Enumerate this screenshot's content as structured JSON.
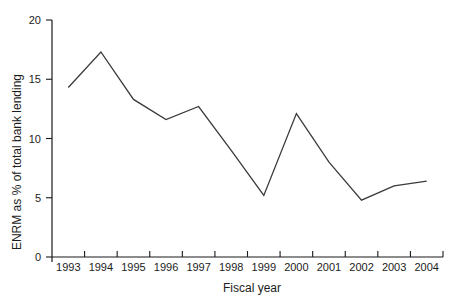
{
  "chart_data": {
    "type": "line",
    "title": "",
    "xlabel": "Fiscal year",
    "ylabel": "ENRM as % of total bank lending",
    "categories": [
      "1993",
      "1994",
      "1995",
      "1996",
      "1997",
      "1998",
      "1999",
      "2000",
      "2001",
      "2002",
      "2003",
      "2004"
    ],
    "values": [
      14.3,
      17.3,
      13.3,
      11.6,
      12.7,
      9.0,
      5.2,
      12.1,
      8.0,
      4.8,
      6.0,
      6.4
    ],
    "yticks": [
      0,
      5,
      10,
      15,
      20
    ],
    "ylim": [
      0,
      20
    ],
    "grid": false,
    "legend": "none",
    "colors": {
      "line": "#3a3a3a",
      "axis": "#1a1a1a",
      "text": "#1c1c1c",
      "background": "#ffffff"
    }
  }
}
